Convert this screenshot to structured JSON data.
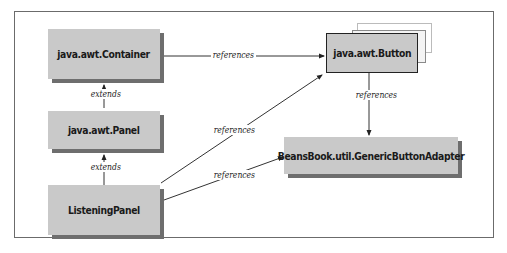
{
  "diagram": {
    "type": "class-relationship-diagram",
    "nodes": [
      {
        "id": "container",
        "label": "java.awt.Container"
      },
      {
        "id": "panel",
        "label": "java.awt.Panel"
      },
      {
        "id": "listening",
        "label": "ListeningPanel"
      },
      {
        "id": "button",
        "label": "java.awt.Button"
      },
      {
        "id": "adapter",
        "label": "BeansBook.util.GenericButtonAdapter"
      }
    ],
    "edges": [
      {
        "from": "panel",
        "to": "container",
        "label": "extends"
      },
      {
        "from": "listening",
        "to": "panel",
        "label": "extends"
      },
      {
        "from": "container",
        "to": "button",
        "label": "references"
      },
      {
        "from": "listening",
        "to": "button",
        "label": "references"
      },
      {
        "from": "listening",
        "to": "adapter",
        "label": "references"
      },
      {
        "from": "button",
        "to": "adapter",
        "label": "references"
      }
    ]
  },
  "colors": {
    "box_fill": "#c9c9c9",
    "box_shadow": "#6e6e6e",
    "line": "#333333",
    "frame": "#6b6b6b"
  }
}
